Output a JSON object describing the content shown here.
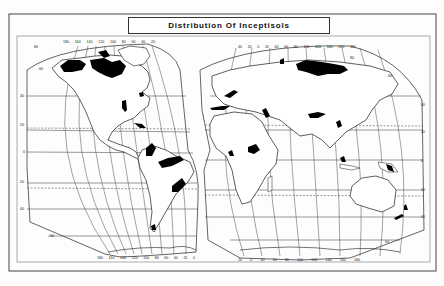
{
  "figure": {
    "title": "Distribution Of Inceptisols",
    "legend_fill_meaning": "Inceptisols (black shaded areas)",
    "colors": {
      "land_outline": "#1a1a1a",
      "soil_fill": "#000000",
      "background": "#ffffff",
      "grid": "#333333"
    }
  },
  "western_hemisphere": {
    "top_longitude_labels": [
      "180",
      "160",
      "140",
      "120",
      "100",
      "80",
      "60",
      "40",
      "20"
    ],
    "bottom_longitude_labels": [
      "180",
      "160",
      "140",
      "120",
      "100",
      "80",
      "60",
      "40",
      "20",
      "0"
    ],
    "latitude_labels": [
      "80",
      "60",
      "40",
      "20",
      "0",
      "20",
      "40",
      "60"
    ]
  },
  "eastern_hemisphere": {
    "top_longitude_labels": [
      "40",
      "20",
      "0",
      "20",
      "40",
      "60",
      "80",
      "100",
      "120",
      "140",
      "160",
      "180"
    ],
    "bottom_longitude_labels": [
      "20",
      "0",
      "40",
      "60",
      "80",
      "100",
      "120",
      "140",
      "160",
      "180"
    ],
    "latitude_labels": [
      "80",
      "60",
      "40",
      "20",
      "0",
      "20",
      "40",
      "60"
    ]
  },
  "regions_shown": [
    "Northern Canada / Alaska",
    "Eastern North America",
    "Mississippi region",
    "Central America / Caribbean",
    "Northern South America (Amazon)",
    "Southern Brazil",
    "Southern Chile",
    "Western Europe",
    "Mediterranean / Turkey",
    "West Africa",
    "Central Africa",
    "Siberia",
    "Himalaya / Indo-Gangetic",
    "Southeast Asia",
    "New Guinea",
    "New Zealand"
  ]
}
